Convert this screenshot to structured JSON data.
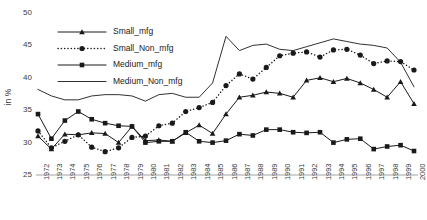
{
  "chart_data": {
    "type": "line",
    "title": "",
    "xlabel": "",
    "ylabel": "in %",
    "ylim": [
      25,
      50
    ],
    "yticks": [
      25,
      30,
      35,
      40,
      45,
      50
    ],
    "grid": false,
    "legend_position": "top-left",
    "categories": [
      "1972",
      "1973",
      "1974",
      "1975",
      "1976",
      "1977",
      "1978",
      "1979",
      "1980",
      "1981",
      "1982",
      "1983",
      "1984",
      "1985",
      "1986",
      "1987",
      "1988",
      "1989",
      "1990",
      "1991",
      "1992",
      "1993",
      "1994",
      "1995",
      "1996",
      "1997",
      "1998",
      "1999",
      "2000"
    ],
    "series": [
      {
        "name": "Small_mfg",
        "marker": "triangle",
        "style": "solid",
        "values": [
          31.0,
          29.0,
          31.3,
          31.2,
          31.5,
          31.4,
          30.0,
          32.5,
          30.3,
          30.4,
          30.2,
          31.5,
          32.7,
          31.4,
          34.4,
          37.0,
          37.3,
          37.8,
          37.6,
          37.0,
          39.6,
          40.0,
          39.4,
          39.9,
          39.2,
          38.2,
          37.0,
          39.4,
          36.0
        ]
      },
      {
        "name": "Small_Non_mfg",
        "marker": "circle",
        "style": "dotted",
        "values": [
          31.8,
          29.2,
          30.2,
          31.2,
          29.3,
          28.6,
          29.2,
          30.8,
          31.0,
          32.6,
          33.0,
          34.8,
          35.4,
          36.2,
          38.8,
          40.6,
          39.8,
          41.6,
          43.4,
          43.8,
          44.0,
          43.2,
          44.3,
          44.4,
          43.5,
          42.2,
          42.6,
          42.5,
          41.2
        ]
      },
      {
        "name": "Medium_mfg",
        "marker": "square",
        "style": "solid",
        "values": [
          34.4,
          30.6,
          33.4,
          34.8,
          33.6,
          33.0,
          32.6,
          32.5,
          30.0,
          30.2,
          30.2,
          31.6,
          30.2,
          30.0,
          30.3,
          31.3,
          31.1,
          32.0,
          32.0,
          31.6,
          31.5,
          31.6,
          30.0,
          30.5,
          30.6,
          29.0,
          29.4,
          29.6,
          28.7
        ]
      },
      {
        "name": "Medium_Non_mfg",
        "marker": "none",
        "style": "solid",
        "values": [
          38.2,
          37.2,
          36.6,
          36.6,
          37.2,
          37.4,
          37.4,
          37.2,
          36.4,
          37.4,
          37.6,
          37.0,
          37.0,
          39.2,
          46.4,
          44.2,
          45.0,
          45.2,
          44.4,
          44.2,
          44.8,
          45.4,
          46.0,
          45.6,
          45.2,
          45.0,
          44.6,
          42.4,
          38.6
        ]
      }
    ]
  },
  "legend": {
    "items": [
      {
        "label": "Small_mfg"
      },
      {
        "label": "Small_Non_mfg"
      },
      {
        "label": "Medium_mfg"
      },
      {
        "label": "Medium_Non_mfg"
      }
    ]
  },
  "colors": {
    "line": "#1a1a1a",
    "text": "#3a3a3a",
    "axis": "#8a8a8a",
    "background": "#ffffff"
  }
}
